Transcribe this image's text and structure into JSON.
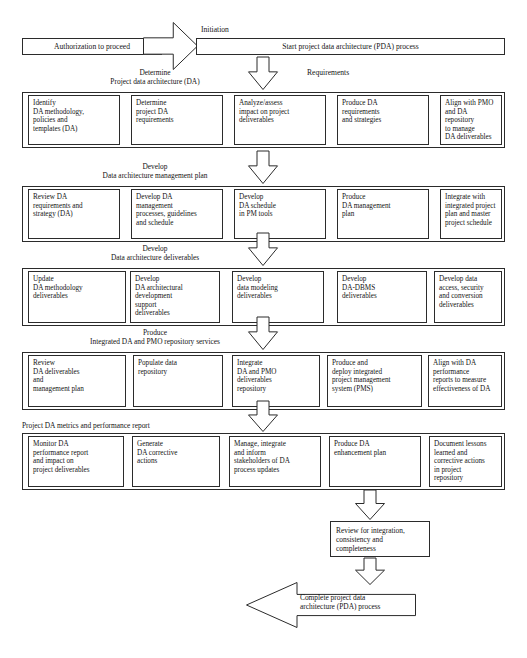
{
  "diagram": {
    "type": "flowchart"
  },
  "start": {
    "authorization_label": "Authorization to proceed",
    "initiation_label": "Initiation",
    "start_process_label": "Start project data architecture (PDA) process",
    "requirements_label": "Requirements"
  },
  "sections": [
    {
      "id": "determine",
      "verb": "Determine",
      "name": "Project data architecture (DA)",
      "label_align": "center",
      "boxes": [
        "Identify\nDA methodology,\npolicies and\ntemplates (DA)",
        "Determine\nproject DA\nrequirements",
        "Analyze/assess\nimpact on project\ndeliverables",
        "Produce DA\nrequirements\nand strategies",
        "Align with PMO\nand DA repository\nto manage\nDA deliverables"
      ]
    },
    {
      "id": "develop-plan",
      "verb": "Develop",
      "name": "Data architecture management plan",
      "label_align": "center",
      "boxes": [
        "Review DA\nrequirements and\nstrategy (DA)",
        "Develop DA\nmanagement\nprocesses, guidelines\nand schedule",
        "Develop\nDA schedule\nin PM tools",
        "Produce\nDA management\nplan",
        "Integrate with\nintegrated project\nplan and master\nproject schedule"
      ]
    },
    {
      "id": "develop-deliverables",
      "verb": "Develop",
      "name": "Data architecture deliverables",
      "label_align": "center",
      "boxes": [
        "Update\nDA methodology\ndeliverables",
        "Develop\nDA architectural\ndevelopment\nsupport\ndeliverables",
        "Develop\ndata modeling\ndeliverables",
        "Develop\nDA-DBMS\ndeliverables",
        "Develop data\naccess, security\nand conversion\ndeliverables"
      ]
    },
    {
      "id": "produce-repository",
      "verb": "Produce",
      "name": "Integrated DA and PMO repository services",
      "label_align": "center",
      "boxes": [
        "Review\nDA deliverables\nand\nmanagement plan",
        "Populate data\nrepository",
        "Integrate\nDA and PMO\ndeliverables\nrepository",
        "Produce and\ndeploy integrated\nproject management\nsystem (PMS)",
        "Align with DA\nperformance\nreports to measure\neffectiveness of DA"
      ]
    },
    {
      "id": "metrics",
      "verb": "",
      "name": "Project DA metrics and performance report",
      "label_align": "left",
      "boxes": [
        "Monitor DA\nperformance report\nand impact on\nproject deliverables",
        "Generate\nDA corrective\nactions",
        "Manage, integrate\nand inform\nstakeholders of DA\nprocess updates",
        "Produce DA\nenhancement plan",
        "Document lessons\nlearned and\ncorrective actions\nin project\nrepository"
      ]
    }
  ],
  "review": {
    "label": "Review for integration,\nconsistency and\ncompleteness"
  },
  "complete": {
    "label": "Complete project data\narchitecture (PDA) process"
  },
  "colors": {
    "stroke": "#2b2b2b",
    "fill": "#ffffff",
    "text": "#141414"
  }
}
